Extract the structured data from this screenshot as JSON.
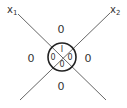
{
  "diagram": {
    "type": "venn-like crossing lines with central circle",
    "axes": {
      "x1": {
        "label": "x",
        "subscript": "1"
      },
      "x2": {
        "label": "x",
        "subscript": "2"
      }
    },
    "outer_regions": {
      "top": "0",
      "left": "0",
      "right": "0",
      "bottom": "0"
    },
    "inner_regions": {
      "top": "I",
      "left": "0",
      "right": "0",
      "bottom": "0"
    },
    "colors": {
      "line": "#555555",
      "circle": "#222222",
      "text": "#333333"
    }
  }
}
